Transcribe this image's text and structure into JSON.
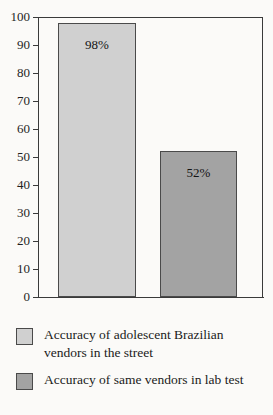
{
  "chart_data": {
    "type": "bar",
    "title": "",
    "xlabel": "",
    "ylabel": "",
    "ylim": [
      0,
      100
    ],
    "yticks": [
      0,
      10,
      20,
      30,
      40,
      50,
      60,
      70,
      80,
      90,
      100
    ],
    "ytick_labels": [
      "0",
      "10",
      "20",
      "30",
      "40",
      "50",
      "60",
      "70",
      "80",
      "90",
      "100"
    ],
    "grid": false,
    "legend_position": "below",
    "categories": [
      "Accuracy of adolescent Brazilian vendors in the street",
      "Accuracy of same vendors in lab test"
    ],
    "values": [
      98,
      52
    ],
    "data_labels": [
      "98%",
      "52%"
    ],
    "colors": [
      "#d0d0d0",
      "#a3a3a3"
    ],
    "bar_border_color": "#4a4a4a",
    "axis_color": "#3a3a3a",
    "background_color": "#fbfaf8"
  },
  "bars": [
    {
      "name": "street-vendors",
      "value": 98,
      "label": "98%",
      "color": "#d0d0d0"
    },
    {
      "name": "lab-test",
      "value": 52,
      "label": "52%",
      "color": "#a3a3a3"
    }
  ],
  "legend": {
    "items": [
      {
        "label": "Accuracy of adolescent Brazilian vendors in the street",
        "color": "#d0d0d0"
      },
      {
        "label": "Accuracy of same vendors in lab test",
        "color": "#a3a3a3"
      }
    ]
  }
}
